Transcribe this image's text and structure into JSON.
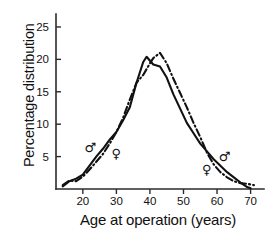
{
  "chart_data": {
    "type": "line",
    "title": "",
    "xlabel": "Age at operation (years)",
    "ylabel": "Percentage distribution",
    "xlim": [
      12,
      74
    ],
    "ylim": [
      0,
      27
    ],
    "xticks": [
      20,
      30,
      40,
      50,
      60,
      70
    ],
    "yticks": [
      5,
      10,
      15,
      20,
      25
    ],
    "grid": false,
    "legend_position": "inline-symbols",
    "series": [
      {
        "name": "male",
        "symbol": "♂",
        "linestyle": "solid",
        "x": [
          14,
          16,
          18,
          20,
          22,
          24,
          26,
          28,
          30,
          32,
          34,
          36,
          38,
          39,
          41,
          43,
          45,
          47,
          49,
          51,
          53,
          55,
          57,
          59,
          61,
          63,
          65,
          67,
          69,
          70
        ],
        "y": [
          0.4,
          1.2,
          1.6,
          2.2,
          3.6,
          5.0,
          6.2,
          7.6,
          8.8,
          10.6,
          12.6,
          16.4,
          19.6,
          20.4,
          19.2,
          18.9,
          17.2,
          14.6,
          12.4,
          10.2,
          8.6,
          7.0,
          5.8,
          4.6,
          3.6,
          2.6,
          1.8,
          1.0,
          0.3,
          0.1
        ]
      },
      {
        "name": "female",
        "symbol": "♀",
        "linestyle": "dash-dot",
        "x": [
          14,
          16,
          18,
          20,
          22,
          24,
          26,
          28,
          30,
          32,
          34,
          36,
          38,
          40,
          41,
          43,
          45,
          47,
          49,
          51,
          53,
          55,
          57,
          59,
          61,
          63,
          65,
          67,
          69,
          71
        ],
        "y": [
          0.6,
          1.3,
          1.2,
          1.9,
          3.0,
          4.2,
          5.4,
          7.0,
          8.8,
          11.0,
          13.8,
          16.4,
          17.6,
          19.4,
          20.2,
          21.0,
          19.4,
          17.0,
          14.8,
          12.6,
          10.2,
          8.0,
          5.6,
          3.8,
          2.6,
          1.8,
          1.2,
          0.9,
          0.8,
          0.6
        ]
      }
    ],
    "annotations": [
      {
        "symbol": "♂",
        "series": "male",
        "x": 22,
        "y": 6.4,
        "name": "male-marker-left"
      },
      {
        "symbol": "♀",
        "series": "female",
        "x": 30,
        "y": 5.4,
        "name": "female-marker-left"
      },
      {
        "symbol": "♂",
        "series": "male",
        "x": 62,
        "y": 4.9,
        "name": "male-marker-right"
      },
      {
        "symbol": "♀",
        "series": "female",
        "x": 57,
        "y": 2.9,
        "name": "female-marker-right"
      }
    ],
    "colors": {
      "line": "#111111",
      "axis": "#2b2b2b",
      "background": "#ffffff"
    }
  },
  "axis": {
    "x_tick_labels": [
      "20",
      "30",
      "40",
      "50",
      "60",
      "70"
    ],
    "y_tick_labels": [
      "5",
      "10",
      "15",
      "20",
      "25"
    ],
    "x_title": "Age at operation (years)",
    "y_title": "Percentage distribution"
  },
  "markers": {
    "male_left": "♂",
    "female_left": "♀",
    "male_right": "♂",
    "female_right": "♀"
  }
}
